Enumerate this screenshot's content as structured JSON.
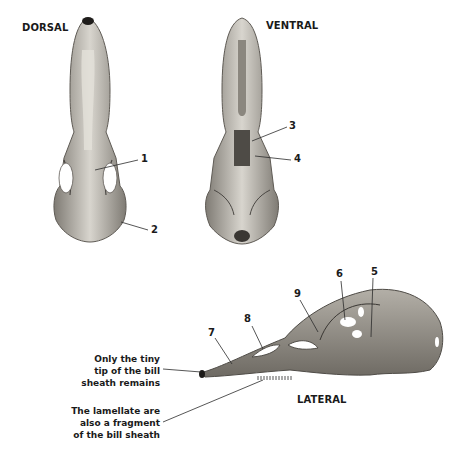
{
  "views": {
    "dorsal": "DORSAL",
    "ventral": "VENTRAL",
    "lateral": "LATERAL"
  },
  "labels": [
    "1",
    "2",
    "3",
    "4",
    "5",
    "6",
    "7",
    "8",
    "9"
  ],
  "notes": {
    "bill_tip": "Only the tiny\ntip of the bill\nsheath remains",
    "lamellae": "The lamellate are\nalso a fragment\nof the bill sheath"
  },
  "colors": {
    "bone_light": "#d9d6cf",
    "bone_mid": "#9c9890",
    "bone_dark": "#5f5b55",
    "line": "#2b2b2b"
  }
}
